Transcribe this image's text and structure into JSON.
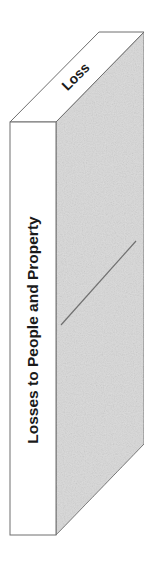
{
  "diagram": {
    "type": "3d-block",
    "front_face": {
      "label": "Losses to People and Property",
      "fill": "#ffffff"
    },
    "top_face": {
      "label": "Loss",
      "fill": "#ffffff"
    },
    "side_face": {
      "fill": "#d9d9d9",
      "texture": "stippled"
    },
    "colors": {
      "stroke": "#6e6e6e",
      "text": "#1a1a1a",
      "diagonal_line": "#707070"
    }
  }
}
